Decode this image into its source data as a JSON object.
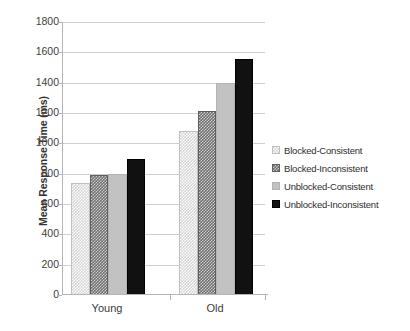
{
  "chart_data": {
    "type": "bar",
    "title": "",
    "xlabel": "",
    "ylabel": "Mean Response Time (ms)",
    "categories": [
      "Young",
      "Old"
    ],
    "series": [
      {
        "name": "Blocked-Consistent",
        "values": [
          740,
          1080
        ],
        "pattern": "light-checker"
      },
      {
        "name": "Blocked-Inconsistent",
        "values": [
          790,
          1215
        ],
        "pattern": "dark-checker"
      },
      {
        "name": "Unblocked-Consistent",
        "values": [
          795,
          1395
        ],
        "pattern": "solid-light-gray"
      },
      {
        "name": "Unblocked-Inconsistent",
        "values": [
          900,
          1555
        ],
        "pattern": "black-dotted"
      }
    ],
    "ylim": [
      0,
      1800
    ],
    "ytick_step": 200,
    "yticks": [
      "1800",
      "1600",
      "1400",
      "1200",
      "1000",
      "800",
      "600",
      "400",
      "200",
      "0"
    ],
    "grid": "horizontal",
    "legend_position": "right"
  }
}
